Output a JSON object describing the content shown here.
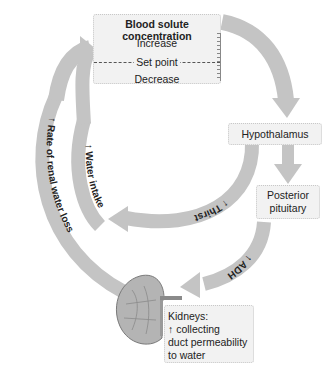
{
  "diagram": {
    "type": "feedback-loop",
    "colors": {
      "arrow": "#c4c4c4",
      "box_bg": "#f2f2f2",
      "text": "#222222"
    },
    "top_box": {
      "title": "Blood solute concentration",
      "increase": "Increase",
      "set_point": "Set point",
      "decrease": "Decrease"
    },
    "hypothalamus": {
      "label": "Hypothalamus"
    },
    "posterior_pituitary": {
      "line1": "Posterior",
      "line2": "pituitary"
    },
    "kidneys": {
      "line1": "Kidneys:",
      "arrow": "↑",
      "line2": "collecting",
      "line3": "duct permeability",
      "line4": "to water"
    },
    "arc_labels": {
      "thirst": "↑ Thirst",
      "water_intake": "↑ Water intake",
      "renal_loss": "↑ Rate of renal water loss",
      "adh": "↑ ADH"
    }
  }
}
